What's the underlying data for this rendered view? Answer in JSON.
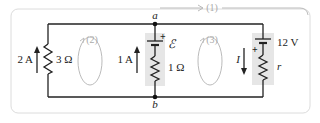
{
  "diagram": {
    "type": "circuit",
    "nodes": {
      "a": "a",
      "b": "b"
    },
    "left_branch": {
      "current_label": "2 A",
      "current_direction": "up",
      "resistor_label": "3 Ω"
    },
    "middle_branch": {
      "current_label": "1 A",
      "current_direction": "up",
      "emf_label": "ℰ",
      "plus_sign": "+",
      "resistor_label": "1 Ω"
    },
    "right_branch": {
      "current_label": "I",
      "current_direction": "down",
      "emf_label": "12 V",
      "plus_sign": "+",
      "resistor_label": "r"
    },
    "loops": [
      {
        "id": "loop-1",
        "label": "(1)"
      },
      {
        "id": "loop-2",
        "label": "(2)"
      },
      {
        "id": "loop-3",
        "label": "(3)"
      }
    ],
    "colors": {
      "wire": "#222222",
      "loop": "#b8b8b8",
      "shade": "#e6e6e6",
      "frame": "#dddddd"
    }
  }
}
